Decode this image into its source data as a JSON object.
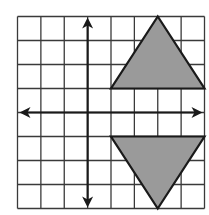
{
  "diagram": {
    "type": "coordinate-grid",
    "x_range": [
      -3,
      5
    ],
    "y_range": [
      -4,
      4
    ],
    "grid_color": "#3a3a3a",
    "axis_color": "#1a1a1a",
    "shape_fill": "#9a9a9a",
    "shape_stroke": "#1a1a1a",
    "shapes": [
      {
        "name": "upper-triangle",
        "points": [
          [
            1,
            1
          ],
          [
            5,
            1
          ],
          [
            3,
            4
          ]
        ]
      },
      {
        "name": "lower-triangle",
        "points": [
          [
            1,
            -1
          ],
          [
            5,
            -1
          ],
          [
            3,
            -4
          ]
        ]
      }
    ]
  }
}
